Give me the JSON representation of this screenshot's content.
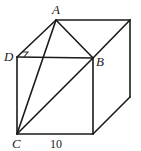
{
  "diagram": {
    "type": "cube",
    "labels": {
      "A": "A",
      "B": "B",
      "C": "C",
      "D": "D"
    },
    "edge_length_label": "10",
    "vertices": {
      "A": [
        56,
        20
      ],
      "top_back_right": [
        130,
        20
      ],
      "D": [
        17,
        57
      ],
      "B": [
        93,
        58
      ],
      "C": [
        17,
        134
      ],
      "front_bottom_right": [
        93,
        134
      ],
      "back_bottom_right": [
        130,
        97
      ]
    },
    "segments": [
      [
        "A",
        "top_back_right"
      ],
      [
        "A",
        "D"
      ],
      [
        "A",
        "B"
      ],
      [
        "A",
        "C"
      ],
      [
        "D",
        "B"
      ],
      [
        "D",
        "C"
      ],
      [
        "C",
        "B"
      ],
      [
        "B",
        "top_back_right"
      ],
      [
        "B",
        "front_bottom_right"
      ],
      [
        "C",
        "front_bottom_right"
      ],
      [
        "top_back_right",
        "back_bottom_right"
      ],
      [
        "front_bottom_right",
        "back_bottom_right"
      ]
    ],
    "right_angle_at": "D",
    "colors": {
      "line": "#1a1a1a",
      "text": "#222222",
      "background": "#ffffff"
    }
  }
}
